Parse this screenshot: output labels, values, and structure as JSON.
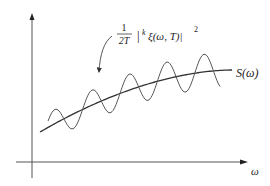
{
  "diagram": {
    "annotation": {
      "fraction_numerator": "1",
      "fraction_denominator": "2T",
      "body": "|",
      "superscript_k": "k",
      "expression": "ξ(ω, T)|",
      "exponent": "2"
    },
    "curve_label": "S(ω)",
    "x_axis_label": "ω",
    "colors": {
      "axis": "#555555",
      "curve": "#333333",
      "wave": "#555555"
    }
  }
}
